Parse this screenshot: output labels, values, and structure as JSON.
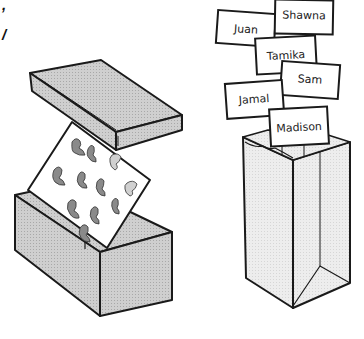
{
  "text_fragments": [
    ",",
    "/"
  ],
  "illustration": {
    "left_object": "box with lid and card of dinosaur pictures",
    "right_object": "paper bag with name cards",
    "name_cards": [
      "Juan",
      "Shawna",
      "Tamika",
      "Sam",
      "Jamal",
      "Madison"
    ],
    "colors": {
      "outline": "#1a1a1a",
      "box_gray": "#c8c8c8",
      "box_gray_dark": "#b4b4b4",
      "bag_light": "#e8e8e8",
      "card_white": "#ffffff",
      "dino_gray": "#8a8a8a"
    }
  }
}
